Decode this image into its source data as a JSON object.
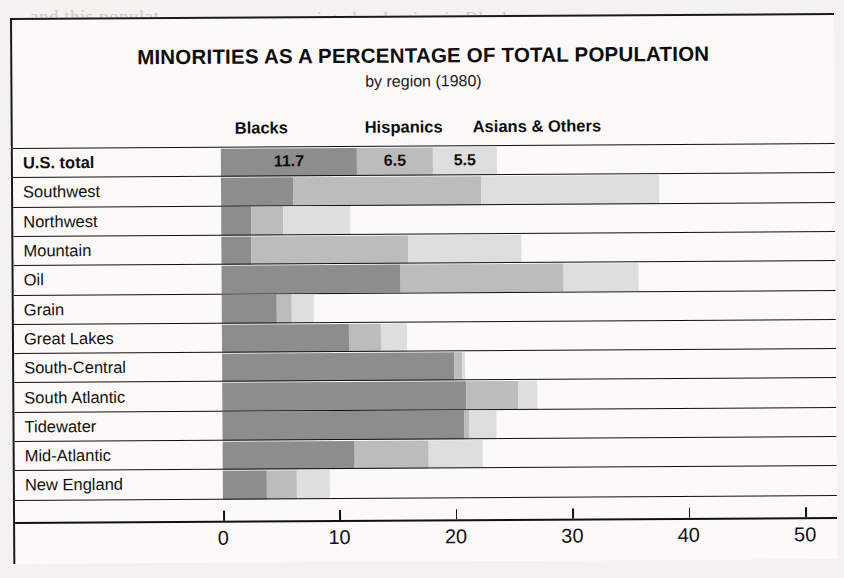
{
  "chart_data": {
    "type": "bar",
    "orientation": "horizontal",
    "stacked": true,
    "title": "MINORITIES AS A PERCENTAGE OF TOTAL POPULATION",
    "subtitle": "by region (1980)",
    "xlabel": "",
    "ylabel": "",
    "xlim": [
      0,
      55
    ],
    "xticks": [
      0,
      10,
      20,
      30,
      40,
      50
    ],
    "xtick_labels": [
      "0",
      "10",
      "20",
      "30",
      "40",
      "50"
    ],
    "grid": false,
    "legend_position": "top",
    "categories": [
      "U.S. total",
      "Southwest",
      "Northwest",
      "Mountain",
      "Oil",
      "Grain",
      "Great Lakes",
      "South-Central",
      "South Atlantic",
      "Tidewater",
      "Mid-Atlantic",
      "New England"
    ],
    "series": [
      {
        "name": "Blacks",
        "color": "#8d8d8d",
        "values": [
          11.7,
          6.2,
          2.6,
          2.6,
          15.4,
          4.7,
          10.9,
          19.9,
          21.0,
          20.8,
          11.3,
          3.8
        ]
      },
      {
        "name": "Hispanics",
        "color": "#bcbcbc",
        "values": [
          6.5,
          16.1,
          2.7,
          13.5,
          14.0,
          1.3,
          2.8,
          0.7,
          4.4,
          0.4,
          6.4,
          2.6
        ]
      },
      {
        "name": "Asians & Others",
        "color": "#dedede",
        "values": [
          5.5,
          15.3,
          5.8,
          9.7,
          6.4,
          1.9,
          2.2,
          0.3,
          1.7,
          2.3,
          4.6,
          2.8
        ]
      }
    ],
    "value_labels_row": "U.S. total",
    "value_labels": [
      "11.7",
      "6.5",
      "5.5"
    ]
  },
  "legend": {
    "items": [
      {
        "label": "Blacks",
        "left_px": 222
      },
      {
        "label": "Hispanics",
        "left_px": 352
      },
      {
        "label": "Asians & Others",
        "left_px": 460
      }
    ]
  },
  "page_background_text": [
    {
      "text": "printed reduction in Blacks or",
      "left": 300,
      "top": 8
    },
    {
      "text": "and this populat",
      "left": 30,
      "top": 6
    },
    {
      "text": "the reduction of the",
      "left": 620,
      "top": 30
    },
    {
      "text": "se while in 1975",
      "left": 640,
      "top": 55
    },
    {
      "text": "The Oil and Western regions",
      "left": 420,
      "top": 78
    },
    {
      "text": "a region accounted for 189",
      "left": 380,
      "top": 100
    },
    {
      "text": "Widely",
      "left": 370,
      "top": 230
    },
    {
      "text": "production of regions",
      "left": 120,
      "top": 252
    },
    {
      "text": "a region in the",
      "left": 620,
      "top": 248
    },
    {
      "text": "and interest, but",
      "left": 80,
      "top": 276
    },
    {
      "text": "for a contract that",
      "left": 450,
      "top": 300
    },
    {
      "text": "in America, oil",
      "left": 100,
      "top": 540
    },
    {
      "text": "The nonfarm sector",
      "left": 440,
      "top": 520
    }
  ]
}
